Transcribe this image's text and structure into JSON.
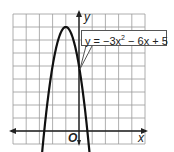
{
  "chart_data": {
    "type": "line",
    "title": "",
    "equation": "y = −3x² − 6x + 5",
    "equation_parts": {
      "pre": "y = −3x",
      "exp": "2",
      "post": " − 6x + 5"
    },
    "xlabel": "x",
    "ylabel": "y",
    "origin_label": "O",
    "grid": true,
    "xlim": [
      -5,
      5
    ],
    "ylim": [
      -1,
      9
    ],
    "grid_step": 1,
    "series": [
      {
        "name": "y = -3x^2 - 6x + 5",
        "x": [
          -2.85,
          -2.633,
          -2.5,
          -2,
          -1.5,
          -1,
          -0.5,
          0,
          0.5,
          0.633,
          0.85
        ],
        "values": [
          -1.27,
          0,
          0.25,
          5,
          7.25,
          8,
          7.25,
          5,
          0.25,
          0,
          -1.27
        ]
      }
    ],
    "vertex": {
      "x": -1,
      "y": 8
    },
    "roots": [
      -2.633,
      0.633
    ],
    "y_intercept": 5
  },
  "colors": {
    "grid": "#9a9a9a",
    "axis": "#222222",
    "curve": "#111111",
    "background": "#ffffff"
  }
}
